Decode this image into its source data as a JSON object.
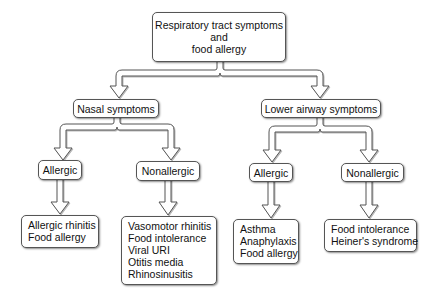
{
  "diagram": {
    "root": {
      "lines": [
        "Respiratory tract symptoms",
        "and",
        "food allergy"
      ]
    },
    "nasal": {
      "label": "Nasal symptoms",
      "allergic": {
        "label": "Allergic",
        "items": [
          "Allergic rhinitis",
          "Food allergy"
        ]
      },
      "nonallergic": {
        "label": "Nonallergic",
        "items": [
          "Vasomotor rhinitis",
          "Food intolerance",
          "Viral URI",
          "Otitis media",
          "Rhinosinusitis"
        ]
      }
    },
    "lower": {
      "label": "Lower airway symptoms",
      "allergic": {
        "label": "Allergic",
        "items": [
          "Asthma",
          "Anaphylaxis",
          "Food allergy"
        ]
      },
      "nonallergic": {
        "label": "Nonallergic",
        "items": [
          "Food intolerance",
          "Heiner's syndrome"
        ]
      }
    },
    "colors": {
      "stroke": "#555555",
      "fill": "#ffffff",
      "shadow": "#888888"
    }
  }
}
